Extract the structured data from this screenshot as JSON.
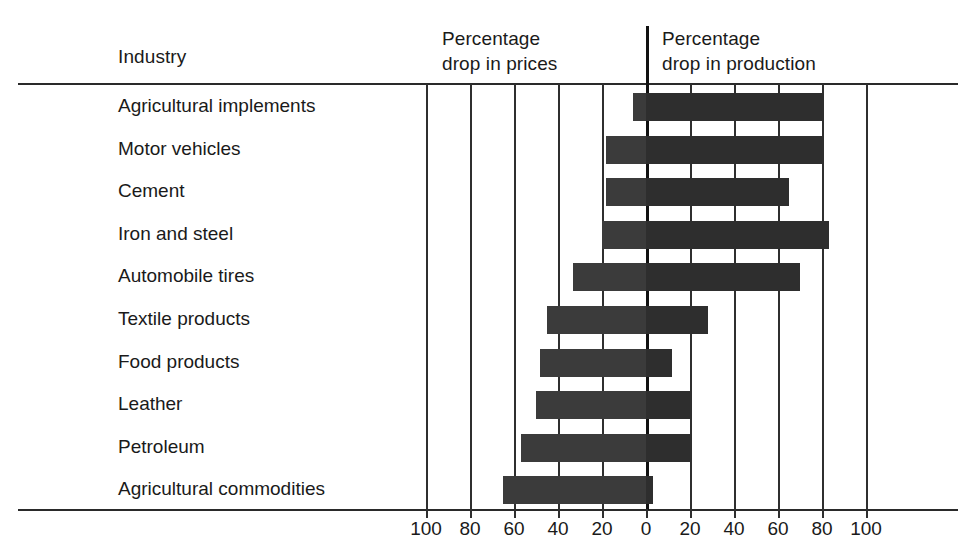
{
  "header": {
    "industry_label": "Industry",
    "prices_label": "Percentage\ndrop in prices",
    "production_label": "Percentage\ndrop in production"
  },
  "axis": {
    "tick_labels": [
      "100",
      "80",
      "60",
      "40",
      "20",
      "0",
      "20",
      "40",
      "60",
      "80",
      "100"
    ],
    "tick_values": [
      -100,
      -80,
      -60,
      -40,
      -20,
      0,
      20,
      40,
      60,
      80,
      100
    ],
    "min": -100,
    "max": 100
  },
  "style": {
    "bar_color": "#3b3b3b",
    "bar_color_right": "#2e2e2e",
    "rule_color": "#2a2a2a",
    "grid_color": "#2f2f2f",
    "text_color": "#1a1a1a",
    "background": "#ffffff"
  },
  "chart_data": {
    "type": "bar",
    "orientation": "horizontal",
    "subtype": "diverging-paired-bar",
    "title": "",
    "xlabel": "",
    "ylabel": "Industry",
    "xlim": [
      -100,
      100
    ],
    "grid": true,
    "legend": false,
    "categories": [
      "Agricultural implements",
      "Motor vehicles",
      "Cement",
      "Iron and steel",
      "Automobile tires",
      "Textile products",
      "Food products",
      "Leather",
      "Petroleum",
      "Agricultural commodities"
    ],
    "series": [
      {
        "name": "Percentage drop in prices",
        "side": "left",
        "values": [
          6,
          18,
          18,
          20,
          33,
          45,
          48,
          50,
          57,
          65
        ]
      },
      {
        "name": "Percentage drop in production",
        "side": "right",
        "values": [
          80,
          80,
          65,
          83,
          70,
          28,
          12,
          20,
          20,
          3
        ]
      }
    ]
  }
}
